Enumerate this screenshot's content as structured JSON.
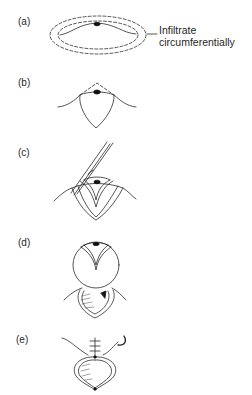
{
  "figure": {
    "panels": [
      {
        "id": "a",
        "label": "(a)",
        "description": "Lesion on skin with dashed circumferential infiltration boundaries"
      },
      {
        "id": "b",
        "label": "(b)",
        "description": "Elliptical/tear-drop incision outline with dashed apex"
      },
      {
        "id": "c",
        "label": "(c)",
        "description": "Forceps lifting skin flap from wound"
      },
      {
        "id": "d",
        "label": "(d)",
        "description": "Flap rotated up exposing wound bed"
      },
      {
        "id": "e",
        "label": "(e)",
        "description": "Wound closed with sutures and needle"
      }
    ],
    "annotations": {
      "infiltrate_line1": "Infiltrate",
      "infiltrate_line2": "circumferentially"
    }
  }
}
